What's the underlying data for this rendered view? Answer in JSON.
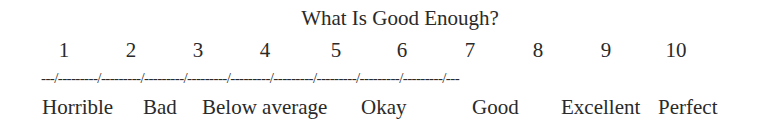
{
  "title": "What Is Good Enough?",
  "scale": {
    "numbers": [
      "1",
      "2",
      "3",
      "4",
      "5",
      "6",
      "7",
      "8",
      "9",
      "10"
    ],
    "dash_line": "---/---------/---------/---------/---------/---------/---------/---------/---------/---------/---",
    "labels": [
      "Horrible",
      "Bad",
      "Below average",
      "Okay",
      "Good",
      "Excellent",
      "Perfect"
    ]
  }
}
